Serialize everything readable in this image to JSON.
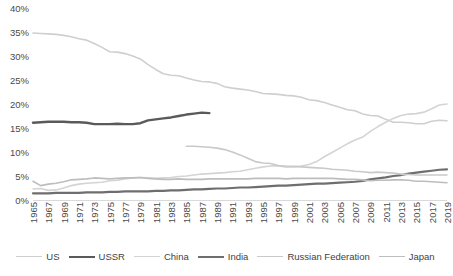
{
  "chart_data": {
    "type": "line",
    "title": "",
    "subtitle": "",
    "xlabel": "",
    "ylabel": "",
    "xlim": [
      1965,
      2019
    ],
    "ylim": [
      0,
      40
    ],
    "ytick_labels": [
      "0%",
      "5%",
      "10%",
      "15%",
      "20%",
      "25%",
      "30%",
      "35%",
      "40%"
    ],
    "ytick_values": [
      0,
      5,
      10,
      15,
      20,
      25,
      30,
      35,
      40
    ],
    "grid": false,
    "legend_position": "bottom",
    "x": [
      1965,
      1966,
      1967,
      1968,
      1969,
      1970,
      1971,
      1972,
      1973,
      1974,
      1975,
      1976,
      1977,
      1978,
      1979,
      1980,
      1981,
      1982,
      1983,
      1984,
      1985,
      1986,
      1987,
      1988,
      1989,
      1990,
      1991,
      1992,
      1993,
      1994,
      1995,
      1996,
      1997,
      1998,
      1999,
      2000,
      2001,
      2002,
      2003,
      2004,
      2005,
      2006,
      2007,
      2008,
      2009,
      2010,
      2011,
      2012,
      2013,
      2014,
      2015,
      2016,
      2017,
      2018,
      2019
    ],
    "xtick_labels": [
      "1965",
      "1967",
      "1969",
      "1971",
      "1973",
      "1975",
      "1977",
      "1979",
      "1981",
      "1983",
      "1985",
      "1987",
      "1989",
      "1991",
      "1993",
      "1995",
      "1997",
      "1999",
      "2001",
      "2003",
      "2005",
      "2007",
      "2009",
      "2011",
      "2013",
      "2015",
      "2017",
      "2019"
    ],
    "series": [
      {
        "name": "US",
        "color": "#cfcfcf",
        "width": 1.6,
        "start_year": 1965,
        "values": [
          34.8,
          34.7,
          34.6,
          34.5,
          34.3,
          34.0,
          33.6,
          33.3,
          32.6,
          31.8,
          30.9,
          30.8,
          30.5,
          30.0,
          29.4,
          28.2,
          27.2,
          26.3,
          26.0,
          25.9,
          25.4,
          25.0,
          24.7,
          24.6,
          24.3,
          23.6,
          23.3,
          23.1,
          22.9,
          22.6,
          22.2,
          22.1,
          22.0,
          21.8,
          21.7,
          21.4,
          20.9,
          20.7,
          20.3,
          19.8,
          19.3,
          18.8,
          18.6,
          17.9,
          17.6,
          17.5,
          16.8,
          16.2,
          16.2,
          16.1,
          15.9,
          15.9,
          16.4,
          16.6,
          16.5
        ]
      },
      {
        "name": "USSR",
        "color": "#5a5a5a",
        "width": 2.4,
        "start_year": 1965,
        "values": [
          16.1,
          16.2,
          16.3,
          16.3,
          16.3,
          16.2,
          16.2,
          16.1,
          15.8,
          15.8,
          15.8,
          15.9,
          15.8,
          15.8,
          16.0,
          16.6,
          16.8,
          17.0,
          17.2,
          17.5,
          17.8,
          18.0,
          18.2,
          18.1,
          null,
          null,
          null,
          null,
          null,
          null,
          null,
          null,
          null,
          null,
          null,
          null,
          null,
          null,
          null,
          null,
          null,
          null,
          null,
          null,
          null,
          null,
          null,
          null,
          null,
          null,
          null,
          null,
          null,
          null,
          null
        ]
      },
      {
        "name": "China",
        "color": "#d4d4d4",
        "width": 1.6,
        "start_year": 1965,
        "values": [
          2.3,
          2.4,
          2.0,
          2.1,
          2.5,
          3.0,
          3.3,
          3.5,
          3.6,
          3.7,
          4.0,
          4.1,
          4.4,
          4.6,
          4.7,
          4.6,
          4.5,
          4.6,
          4.7,
          4.9,
          5.0,
          5.2,
          5.4,
          5.5,
          5.6,
          5.7,
          5.9,
          6.0,
          6.3,
          6.6,
          6.9,
          7.1,
          7.1,
          6.9,
          6.9,
          7.1,
          7.4,
          8.0,
          9.0,
          9.9,
          10.8,
          11.7,
          12.5,
          13.1,
          14.3,
          15.3,
          16.2,
          17.0,
          17.6,
          17.9,
          18.0,
          18.3,
          19.0,
          19.8,
          20.0
        ]
      },
      {
        "name": "India",
        "color": "#6e6e6e",
        "width": 2.2,
        "start_year": 1965,
        "values": [
          1.4,
          1.4,
          1.4,
          1.5,
          1.5,
          1.5,
          1.5,
          1.6,
          1.6,
          1.6,
          1.7,
          1.7,
          1.8,
          1.8,
          1.8,
          1.8,
          1.9,
          1.9,
          2.0,
          2.0,
          2.1,
          2.2,
          2.2,
          2.3,
          2.4,
          2.4,
          2.5,
          2.6,
          2.6,
          2.7,
          2.8,
          2.9,
          3.0,
          3.0,
          3.1,
          3.2,
          3.3,
          3.4,
          3.4,
          3.5,
          3.6,
          3.7,
          3.8,
          4.0,
          4.3,
          4.5,
          4.7,
          5.0,
          5.2,
          5.5,
          5.7,
          5.9,
          6.1,
          6.3,
          6.4
        ]
      },
      {
        "name": "Russian Federation",
        "color": "#c9c9c9",
        "width": 1.6,
        "start_year": 1985,
        "values": [
          null,
          null,
          null,
          null,
          null,
          null,
          null,
          null,
          null,
          null,
          null,
          null,
          null,
          null,
          null,
          null,
          null,
          null,
          null,
          null,
          11.2,
          11.2,
          11.1,
          11.0,
          10.8,
          10.5,
          10.0,
          9.4,
          8.7,
          8.0,
          7.7,
          7.6,
          7.2,
          7.0,
          7.0,
          6.9,
          6.8,
          6.7,
          6.6,
          6.4,
          6.3,
          6.2,
          6.0,
          5.9,
          5.7,
          5.8,
          5.7,
          5.6,
          5.4,
          5.3,
          5.2,
          5.2,
          5.2,
          5.2,
          5.2
        ]
      },
      {
        "name": "Japan",
        "color": "#bdbdbd",
        "width": 1.6,
        "start_year": 1965,
        "values": [
          3.9,
          3.0,
          3.3,
          3.5,
          3.8,
          4.2,
          4.3,
          4.4,
          4.6,
          4.5,
          4.4,
          4.5,
          4.6,
          4.6,
          4.7,
          4.5,
          4.4,
          4.3,
          4.3,
          4.4,
          4.3,
          4.3,
          4.3,
          4.4,
          4.4,
          4.4,
          4.4,
          4.4,
          4.4,
          4.5,
          4.5,
          4.5,
          4.5,
          4.4,
          4.5,
          4.5,
          4.5,
          4.5,
          4.5,
          4.5,
          4.4,
          4.3,
          4.3,
          4.2,
          4.0,
          4.1,
          4.1,
          4.2,
          4.2,
          4.1,
          3.9,
          3.9,
          3.8,
          3.7,
          3.6
        ]
      }
    ]
  },
  "legend": {
    "items": [
      {
        "label": "US"
      },
      {
        "label": "USSR"
      },
      {
        "label": "China"
      },
      {
        "label": "India"
      },
      {
        "label": "Russian Federation"
      },
      {
        "label": "Japan"
      }
    ]
  }
}
